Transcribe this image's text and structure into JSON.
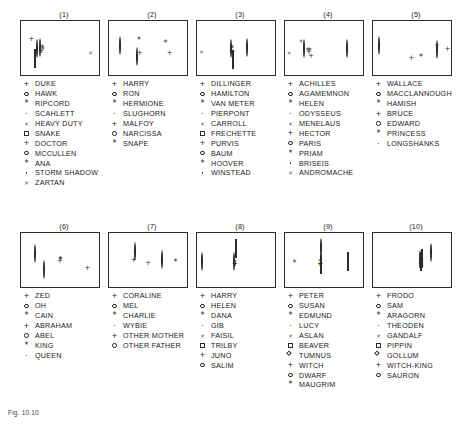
{
  "figure": {
    "caption": "Fig. 10.10",
    "width": 472,
    "height": 425,
    "background": "#ffffff",
    "ink_color": "#2b2b2b"
  },
  "chart_data": {
    "type": "scatter",
    "title": "",
    "xlabel": "",
    "ylabel": "",
    "grid": false,
    "legend_position": "below-each-panel",
    "axis_ranges": {
      "x": [
        0,
        1
      ],
      "y": [
        0,
        1
      ]
    },
    "marker_glyphs": [
      "plus",
      "circle",
      "asterisk",
      "dot",
      "cross",
      "square",
      "plus",
      "circle",
      "asterisk",
      "dot"
    ],
    "panels": [
      {
        "label": "(1)",
        "legend": [
          {
            "glyph": "plus",
            "name": "DUKE"
          },
          {
            "glyph": "circle",
            "name": "HAWK"
          },
          {
            "glyph": "asterisk",
            "name": "RIPCORD"
          },
          {
            "glyph": "dot",
            "name": "SCAHLETT"
          },
          {
            "glyph": "cross",
            "name": "HEAVY DUTY"
          },
          {
            "glyph": "square",
            "name": "SNAKE"
          },
          {
            "glyph": "plus",
            "name": "DOCTOR"
          },
          {
            "glyph": "circle",
            "name": "MCCULLEN"
          },
          {
            "glyph": "asterisk",
            "name": "ANA"
          },
          {
            "glyph": "dot",
            "name": "STORM SHADOW"
          },
          {
            "glyph": "cross",
            "name": "ZARTAN"
          }
        ],
        "points": [
          {
            "glyph": "plus",
            "x": 0.13,
            "y": 0.735
          },
          {
            "glyph": "circle",
            "x": 0.205,
            "y": 0.505
          },
          {
            "glyph": "asterisk",
            "x": 0.265,
            "y": 0.545
          },
          {
            "glyph": "dot",
            "x": 0.222,
            "y": 0.61
          },
          {
            "glyph": "cross",
            "x": 0.87,
            "y": 0.49
          },
          {
            "glyph": "square",
            "x": 0.178,
            "y": 0.315
          },
          {
            "glyph": "plus",
            "x": 0.252,
            "y": 0.52
          },
          {
            "glyph": "circle",
            "x": 0.243,
            "y": 0.52
          },
          {
            "glyph": "asterisk",
            "x": 0.272,
            "y": 0.525
          },
          {
            "glyph": "dot",
            "x": 0.238,
            "y": 0.528
          },
          {
            "glyph": "cross",
            "x": 0.248,
            "y": 0.512
          }
        ]
      },
      {
        "label": "(2)",
        "legend": [
          {
            "glyph": "plus",
            "name": "HARRY"
          },
          {
            "glyph": "circle",
            "name": "RON"
          },
          {
            "glyph": "asterisk",
            "name": "HERMIONE"
          },
          {
            "glyph": "dot",
            "name": "SLUGHORN"
          },
          {
            "glyph": "plus",
            "name": "MALFOY"
          },
          {
            "glyph": "circle",
            "name": "NARCISSA"
          },
          {
            "glyph": "asterisk",
            "name": "SNAPE"
          }
        ],
        "points": [
          {
            "glyph": "plus",
            "x": 0.385,
            "y": 0.48
          },
          {
            "glyph": "circle",
            "x": 0.14,
            "y": 0.545
          },
          {
            "glyph": "asterisk",
            "x": 0.375,
            "y": 0.705
          },
          {
            "glyph": "dot",
            "x": 0.545,
            "y": 0.45
          },
          {
            "glyph": "plus",
            "x": 0.76,
            "y": 0.48
          },
          {
            "glyph": "circle",
            "x": 0.35,
            "y": 0.355
          },
          {
            "glyph": "asterisk",
            "x": 0.705,
            "y": 0.64
          }
        ]
      },
      {
        "label": "(3)",
        "legend": [
          {
            "glyph": "plus",
            "name": "DILLINGER"
          },
          {
            "glyph": "circle",
            "name": "HAMILTON"
          },
          {
            "glyph": "asterisk",
            "name": "VAN METER"
          },
          {
            "glyph": "dot",
            "name": "PIERPONT"
          },
          {
            "glyph": "cross",
            "name": "CARROLL"
          },
          {
            "glyph": "square",
            "name": "FRECHETTE"
          },
          {
            "glyph": "plus",
            "name": "PURVIS"
          },
          {
            "glyph": "circle",
            "name": "BAUM"
          },
          {
            "glyph": "asterisk",
            "name": "HOOVER"
          },
          {
            "glyph": "dot",
            "name": "WINSTEAD"
          }
        ],
        "points": [
          {
            "glyph": "plus",
            "x": 0.43,
            "y": 0.525
          },
          {
            "glyph": "circle",
            "x": 0.425,
            "y": 0.495
          },
          {
            "glyph": "asterisk",
            "x": 0.432,
            "y": 0.56
          },
          {
            "glyph": "dot",
            "x": 0.428,
            "y": 0.6
          },
          {
            "glyph": "cross",
            "x": 0.055,
            "y": 0.505
          },
          {
            "glyph": "square",
            "x": 0.45,
            "y": 0.3
          },
          {
            "glyph": "plus",
            "x": 0.445,
            "y": 0.505
          },
          {
            "glyph": "circle",
            "x": 0.625,
            "y": 0.52
          },
          {
            "glyph": "asterisk",
            "x": 0.434,
            "y": 0.54
          },
          {
            "glyph": "dot",
            "x": 0.438,
            "y": 0.58
          }
        ]
      },
      {
        "label": "(4)",
        "legend": [
          {
            "glyph": "plus",
            "name": "ACHILLES"
          },
          {
            "glyph": "circle",
            "name": "AGAMEMNON"
          },
          {
            "glyph": "asterisk",
            "name": "HELEN"
          },
          {
            "glyph": "dot",
            "name": "ODYSSEUS"
          },
          {
            "glyph": "cross",
            "name": "MENELAUS"
          },
          {
            "glyph": "plus",
            "name": "HECTOR"
          },
          {
            "glyph": "circle",
            "name": "PARIS"
          },
          {
            "glyph": "asterisk",
            "name": "PRIAM"
          },
          {
            "glyph": "dot",
            "name": "BRISEIS"
          },
          {
            "glyph": "cross",
            "name": "ANDROMACHE"
          }
        ],
        "points": [
          {
            "glyph": "plus",
            "x": 0.3,
            "y": 0.5
          },
          {
            "glyph": "circle",
            "x": 0.24,
            "y": 0.505
          },
          {
            "glyph": "asterisk",
            "x": 0.285,
            "y": 0.5
          },
          {
            "glyph": "dot",
            "x": 0.33,
            "y": 0.465
          },
          {
            "glyph": "cross",
            "x": 0.05,
            "y": 0.49
          },
          {
            "glyph": "plus",
            "x": 0.325,
            "y": 0.43
          },
          {
            "glyph": "circle",
            "x": 0.78,
            "y": 0.5
          },
          {
            "glyph": "asterisk",
            "x": 0.31,
            "y": 0.505
          },
          {
            "glyph": "dot",
            "x": 0.32,
            "y": 0.445
          },
          {
            "glyph": "cross",
            "x": 0.2,
            "y": 0.7
          }
        ]
      },
      {
        "label": "(5)",
        "legend": [
          {
            "glyph": "plus",
            "name": "WALLACE"
          },
          {
            "glyph": "circle",
            "name": "MACCLANNOUGH"
          },
          {
            "glyph": "asterisk",
            "name": "HAMISH"
          },
          {
            "glyph": "plus",
            "name": "BRUCE"
          },
          {
            "glyph": "circle",
            "name": "EDWARD"
          },
          {
            "glyph": "asterisk",
            "name": "PRINCESS"
          },
          {
            "glyph": "dot",
            "name": "LONGSHANKS"
          }
        ],
        "points": [
          {
            "glyph": "plus",
            "x": 0.93,
            "y": 0.545
          },
          {
            "glyph": "circle",
            "x": 0.08,
            "y": 0.555
          },
          {
            "glyph": "asterisk",
            "x": 0.8,
            "y": 0.575
          },
          {
            "glyph": "plus",
            "x": 0.48,
            "y": 0.4
          },
          {
            "glyph": "circle",
            "x": 0.8,
            "y": 0.48
          },
          {
            "glyph": "asterisk",
            "x": 0.6,
            "y": 0.4
          },
          {
            "glyph": "dot",
            "x": 0.797,
            "y": 0.53
          }
        ]
      },
      {
        "label": "(6)",
        "legend": [
          {
            "glyph": "plus",
            "name": "ZED"
          },
          {
            "glyph": "circle",
            "name": "OH"
          },
          {
            "glyph": "asterisk",
            "name": "CAIN"
          },
          {
            "glyph": "plus",
            "name": "ABRAHAM"
          },
          {
            "glyph": "circle",
            "name": "ABEL"
          },
          {
            "glyph": "asterisk",
            "name": "KING"
          },
          {
            "glyph": "dot",
            "name": "QUEEN"
          }
        ],
        "points": [
          {
            "glyph": "plus",
            "x": 0.83,
            "y": 0.43
          },
          {
            "glyph": "circle",
            "x": 0.18,
            "y": 0.62
          },
          {
            "glyph": "asterisk",
            "x": 0.49,
            "y": 0.545
          },
          {
            "glyph": "plus",
            "x": 0.487,
            "y": 0.55
          },
          {
            "glyph": "circle",
            "x": 0.29,
            "y": 0.34
          },
          {
            "glyph": "asterisk",
            "x": 0.495,
            "y": 0.555
          },
          {
            "glyph": "dot",
            "x": 0.5,
            "y": 0.69
          }
        ]
      },
      {
        "label": "(7)",
        "legend": [
          {
            "glyph": "plus",
            "name": "CORALINE"
          },
          {
            "glyph": "circle",
            "name": "MEL"
          },
          {
            "glyph": "asterisk",
            "name": "CHARLIE"
          },
          {
            "glyph": "dot",
            "name": "WYBIE"
          },
          {
            "glyph": "plus",
            "name": "OTHER MOTHER"
          },
          {
            "glyph": "circle",
            "name": "OTHER FATHER"
          }
        ],
        "points": [
          {
            "glyph": "plus",
            "x": 0.31,
            "y": 0.58
          },
          {
            "glyph": "circle",
            "x": 0.33,
            "y": 0.655
          },
          {
            "glyph": "asterisk",
            "x": 0.83,
            "y": 0.52
          },
          {
            "glyph": "dot",
            "x": 0.12,
            "y": 0.29
          },
          {
            "glyph": "plus",
            "x": 0.49,
            "y": 0.52
          },
          {
            "glyph": "circle",
            "x": 0.66,
            "y": 0.52
          }
        ]
      },
      {
        "label": "(8)",
        "legend": [
          {
            "glyph": "plus",
            "name": "HARRY"
          },
          {
            "glyph": "circle",
            "name": "HELEN"
          },
          {
            "glyph": "asterisk",
            "name": "DANA"
          },
          {
            "glyph": "dot",
            "name": "GIB"
          },
          {
            "glyph": "cross",
            "name": "FAISIL"
          },
          {
            "glyph": "square",
            "name": "TRILBY"
          },
          {
            "glyph": "plus",
            "name": "JUNO"
          },
          {
            "glyph": "circle",
            "name": "SALIM"
          }
        ],
        "points": [
          {
            "glyph": "plus",
            "x": 0.47,
            "y": 0.495
          },
          {
            "glyph": "circle",
            "x": 0.065,
            "y": 0.49
          },
          {
            "glyph": "asterisk",
            "x": 0.472,
            "y": 0.505
          },
          {
            "glyph": "dot",
            "x": 0.84,
            "y": 0.49
          },
          {
            "glyph": "cross",
            "x": 0.468,
            "y": 0.5
          },
          {
            "glyph": "square",
            "x": 0.49,
            "y": 0.72
          },
          {
            "glyph": "plus",
            "x": 0.475,
            "y": 0.5
          },
          {
            "glyph": "circle",
            "x": 0.466,
            "y": 0.49
          }
        ]
      },
      {
        "label": "(9)",
        "legend": [
          {
            "glyph": "plus",
            "name": "PETER"
          },
          {
            "glyph": "circle",
            "name": "SUSAN"
          },
          {
            "glyph": "asterisk",
            "name": "EDMUND"
          },
          {
            "glyph": "dot",
            "name": "LUCY"
          },
          {
            "glyph": "cross",
            "name": "ASLAN"
          },
          {
            "glyph": "square",
            "name": "BEAVER"
          },
          {
            "glyph": "diamond",
            "name": "TUMNUS"
          },
          {
            "glyph": "plus",
            "name": "WITCH"
          },
          {
            "glyph": "circle",
            "name": "DWARF"
          },
          {
            "glyph": "asterisk",
            "name": "MAUGRIM"
          }
        ],
        "points": [
          {
            "glyph": "plus",
            "x": 0.44,
            "y": 0.5
          },
          {
            "glyph": "circle",
            "x": 0.45,
            "y": 0.73
          },
          {
            "glyph": "asterisk",
            "x": 0.12,
            "y": 0.5
          },
          {
            "glyph": "dot",
            "x": 0.443,
            "y": 0.42
          },
          {
            "glyph": "cross",
            "x": 0.438,
            "y": 0.505
          },
          {
            "glyph": "square",
            "x": 0.79,
            "y": 0.49
          },
          {
            "glyph": "diamond",
            "x": 0.447,
            "y": 0.435
          },
          {
            "glyph": "plus",
            "x": 0.442,
            "y": 0.495
          },
          {
            "glyph": "circle",
            "x": 0.446,
            "y": 0.47
          },
          {
            "glyph": "asterisk",
            "x": 0.441,
            "y": 0.51
          }
        ]
      },
      {
        "label": "(10)",
        "legend": [
          {
            "glyph": "plus",
            "name": "FRODO"
          },
          {
            "glyph": "circle",
            "name": "SAM"
          },
          {
            "glyph": "asterisk",
            "name": "ARAGORN"
          },
          {
            "glyph": "dot",
            "name": "THEODEN"
          },
          {
            "glyph": "cross",
            "name": "GANDALF"
          },
          {
            "glyph": "square",
            "name": "PIPPIN"
          },
          {
            "glyph": "diamond",
            "name": "GOLLUM"
          },
          {
            "glyph": "plus",
            "name": "WITCH-KING"
          },
          {
            "glyph": "circle",
            "name": "SAURON"
          }
        ],
        "points": [
          {
            "glyph": "plus",
            "x": 0.6,
            "y": 0.505
          },
          {
            "glyph": "circle",
            "x": 0.73,
            "y": 0.64
          },
          {
            "glyph": "asterisk",
            "x": 0.606,
            "y": 0.515
          },
          {
            "glyph": "dot",
            "x": 0.585,
            "y": 0.38
          },
          {
            "glyph": "cross",
            "x": 0.595,
            "y": 0.5
          },
          {
            "glyph": "square",
            "x": 0.612,
            "y": 0.53
          },
          {
            "glyph": "diamond",
            "x": 0.598,
            "y": 0.49
          },
          {
            "glyph": "plus",
            "x": 0.604,
            "y": 0.47
          },
          {
            "glyph": "circle",
            "x": 0.59,
            "y": 0.52
          }
        ]
      }
    ]
  }
}
